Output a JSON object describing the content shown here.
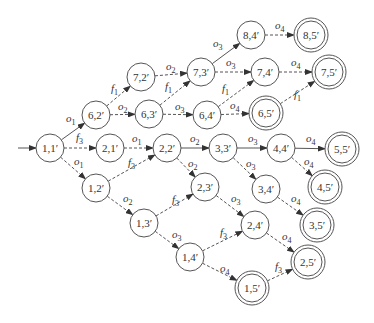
{
  "diagram": {
    "type": "state-transition-graph",
    "colors": {
      "stroke": "#555555",
      "text": "#333333",
      "background": "#ffffff"
    },
    "node_radius": 14,
    "nodes": [
      {
        "id": "n11",
        "label": "1,1′",
        "x": 50,
        "y": 148,
        "accepting": false,
        "initial": true
      },
      {
        "id": "n62",
        "label": "6,2′",
        "x": 96,
        "y": 115,
        "accepting": false
      },
      {
        "id": "n21",
        "label": "2,1′",
        "x": 110,
        "y": 148,
        "accepting": false
      },
      {
        "id": "n12",
        "label": "1,2′",
        "x": 96,
        "y": 188,
        "accepting": false
      },
      {
        "id": "n72",
        "label": "7,2′",
        "x": 141,
        "y": 77,
        "accepting": false
      },
      {
        "id": "n63",
        "label": "6,3′",
        "x": 149,
        "y": 114,
        "accepting": false
      },
      {
        "id": "n22",
        "label": "2,2′",
        "x": 167,
        "y": 148,
        "accepting": false
      },
      {
        "id": "n13",
        "label": "1,3′",
        "x": 144,
        "y": 223,
        "accepting": false
      },
      {
        "id": "n73",
        "label": "7,3′",
        "x": 201,
        "y": 72,
        "accepting": false
      },
      {
        "id": "n64",
        "label": "6,4′",
        "x": 207,
        "y": 115,
        "accepting": false
      },
      {
        "id": "n33",
        "label": "3,3′",
        "x": 223,
        "y": 148,
        "accepting": false
      },
      {
        "id": "n23",
        "label": "2,3′",
        "x": 205,
        "y": 187,
        "accepting": false
      },
      {
        "id": "n14",
        "label": "1,4′",
        "x": 190,
        "y": 257,
        "accepting": false
      },
      {
        "id": "n84",
        "label": "8,4′",
        "x": 251,
        "y": 35,
        "accepting": false
      },
      {
        "id": "n74",
        "label": "7,4′",
        "x": 265,
        "y": 72,
        "accepting": false
      },
      {
        "id": "n65",
        "label": "6,5′",
        "x": 266,
        "y": 113,
        "accepting": true
      },
      {
        "id": "n44",
        "label": "4,4′",
        "x": 281,
        "y": 148,
        "accepting": false
      },
      {
        "id": "n34",
        "label": "3,4′",
        "x": 266,
        "y": 189,
        "accepting": false
      },
      {
        "id": "n24",
        "label": "2,4′",
        "x": 255,
        "y": 225,
        "accepting": false
      },
      {
        "id": "n15",
        "label": "1,5′",
        "x": 252,
        "y": 288,
        "accepting": true
      },
      {
        "id": "n85",
        "label": "8,5′",
        "x": 311,
        "y": 35,
        "accepting": true
      },
      {
        "id": "n75",
        "label": "7,5′",
        "x": 329,
        "y": 72,
        "accepting": true
      },
      {
        "id": "n55",
        "label": "5,5′",
        "x": 342,
        "y": 149,
        "accepting": true
      },
      {
        "id": "n45",
        "label": "4,5′",
        "x": 325,
        "y": 187,
        "accepting": true
      },
      {
        "id": "n35",
        "label": "3,5′",
        "x": 317,
        "y": 225,
        "accepting": true
      },
      {
        "id": "n25",
        "label": "2,5′",
        "x": 308,
        "y": 262,
        "accepting": true
      }
    ],
    "edges": [
      {
        "from": "n11",
        "to": "n62",
        "label": "o1",
        "sub": "1",
        "base": "o",
        "style": "solid",
        "lx": 66,
        "ly": 122
      },
      {
        "from": "n11",
        "to": "n21",
        "label": "f3",
        "sub": "3",
        "base": "f",
        "style": "dashed",
        "lx": 76,
        "ly": 141
      },
      {
        "from": "n11",
        "to": "n12",
        "label": "o1",
        "sub": "1",
        "base": "o",
        "style": "dashed",
        "lx": 74,
        "ly": 165
      },
      {
        "from": "n62",
        "to": "n72",
        "label": "f1",
        "sub": "1",
        "base": "f",
        "style": "dashed",
        "lx": 111,
        "ly": 92
      },
      {
        "from": "n62",
        "to": "n63",
        "label": "o2",
        "sub": "2",
        "base": "o",
        "style": "dashed",
        "lx": 118,
        "ly": 110
      },
      {
        "from": "n21",
        "to": "n22",
        "label": "o1",
        "sub": "1",
        "base": "o",
        "style": "dashed",
        "lx": 132,
        "ly": 142
      },
      {
        "from": "n12",
        "to": "n22",
        "label": "f3",
        "sub": "3",
        "base": "f",
        "style": "dashed",
        "lx": 128,
        "ly": 166
      },
      {
        "from": "n12",
        "to": "n13",
        "label": "o2",
        "sub": "2",
        "base": "o",
        "style": "dashed",
        "lx": 123,
        "ly": 202
      },
      {
        "from": "n72",
        "to": "n73",
        "label": "o2",
        "sub": "2",
        "base": "o",
        "style": "dashed",
        "lx": 166,
        "ly": 70
      },
      {
        "from": "n63",
        "to": "n73",
        "label": "f1",
        "sub": "1",
        "base": "f",
        "style": "dashed",
        "lx": 165,
        "ly": 90
      },
      {
        "from": "n63",
        "to": "n64",
        "label": "o3",
        "sub": "3",
        "base": "o",
        "style": "dashed",
        "lx": 175,
        "ly": 110
      },
      {
        "from": "n22",
        "to": "n33",
        "label": "o2",
        "sub": "2",
        "base": "o",
        "style": "solid",
        "lx": 190,
        "ly": 142
      },
      {
        "from": "n22",
        "to": "n23",
        "label": "o2",
        "sub": "2",
        "base": "o",
        "style": "dashed",
        "lx": 188,
        "ly": 167
      },
      {
        "from": "n13",
        "to": "n23",
        "label": "f3",
        "sub": "3",
        "base": "f",
        "style": "dashed",
        "lx": 172,
        "ly": 203
      },
      {
        "from": "n13",
        "to": "n14",
        "label": "o3",
        "sub": "3",
        "base": "o",
        "style": "dashed",
        "lx": 172,
        "ly": 238
      },
      {
        "from": "n73",
        "to": "n84",
        "label": "o3",
        "sub": "3",
        "base": "o",
        "style": "solid",
        "lx": 213,
        "ly": 47
      },
      {
        "from": "n73",
        "to": "n74",
        "label": "o3",
        "sub": "3",
        "base": "o",
        "style": "dashed",
        "lx": 226,
        "ly": 66
      },
      {
        "from": "n64",
        "to": "n74",
        "label": "f1",
        "sub": "1",
        "base": "f",
        "style": "dashed",
        "lx": 222,
        "ly": 92
      },
      {
        "from": "n64",
        "to": "n65",
        "label": "o4",
        "sub": "4",
        "base": "o",
        "style": "dashed",
        "lx": 230,
        "ly": 109
      },
      {
        "from": "n33",
        "to": "n44",
        "label": "o3",
        "sub": "3",
        "base": "o",
        "style": "solid",
        "lx": 248,
        "ly": 142
      },
      {
        "from": "n33",
        "to": "n34",
        "label": "o3",
        "sub": "3",
        "base": "o",
        "style": "dashed",
        "lx": 246,
        "ly": 167
      },
      {
        "from": "n23",
        "to": "n24",
        "label": "o3",
        "sub": "3",
        "base": "o",
        "style": "dashed",
        "lx": 231,
        "ly": 202
      },
      {
        "from": "n14",
        "to": "n24",
        "label": "f3",
        "sub": "3",
        "base": "f",
        "style": "dashed",
        "lx": 220,
        "ly": 236
      },
      {
        "from": "n14",
        "to": "n15",
        "label": "o4",
        "sub": "4",
        "base": "o",
        "style": "dashed",
        "lx": 220,
        "ly": 272
      },
      {
        "from": "n84",
        "to": "n85",
        "label": "o4",
        "sub": "4",
        "base": "o",
        "style": "dashed",
        "lx": 275,
        "ly": 29
      },
      {
        "from": "n74",
        "to": "n75",
        "label": "o4",
        "sub": "4",
        "base": "o",
        "style": "dashed",
        "lx": 291,
        "ly": 66
      },
      {
        "from": "n65",
        "to": "n75",
        "label": "f1",
        "sub": "1",
        "base": "f",
        "style": "dashed",
        "lx": 294,
        "ly": 98
      },
      {
        "from": "n44",
        "to": "n55",
        "label": "o4",
        "sub": "4",
        "base": "o",
        "style": "solid",
        "lx": 306,
        "ly": 142
      },
      {
        "from": "n44",
        "to": "n45",
        "label": "o4",
        "sub": "4",
        "base": "o",
        "style": "dashed",
        "lx": 304,
        "ly": 165
      },
      {
        "from": "n34",
        "to": "n35",
        "label": "o4",
        "sub": "4",
        "base": "o",
        "style": "dashed",
        "lx": 291,
        "ly": 202
      },
      {
        "from": "n24",
        "to": "n25",
        "label": "o4",
        "sub": "4",
        "base": "o",
        "style": "dashed",
        "lx": 282,
        "ly": 240
      },
      {
        "from": "n15",
        "to": "n25",
        "label": "f3",
        "sub": "3",
        "base": "f",
        "style": "dashed",
        "lx": 275,
        "ly": 270
      }
    ],
    "initial_arrow": {
      "from_x": 18,
      "from_y": 148,
      "to": "n11"
    }
  }
}
